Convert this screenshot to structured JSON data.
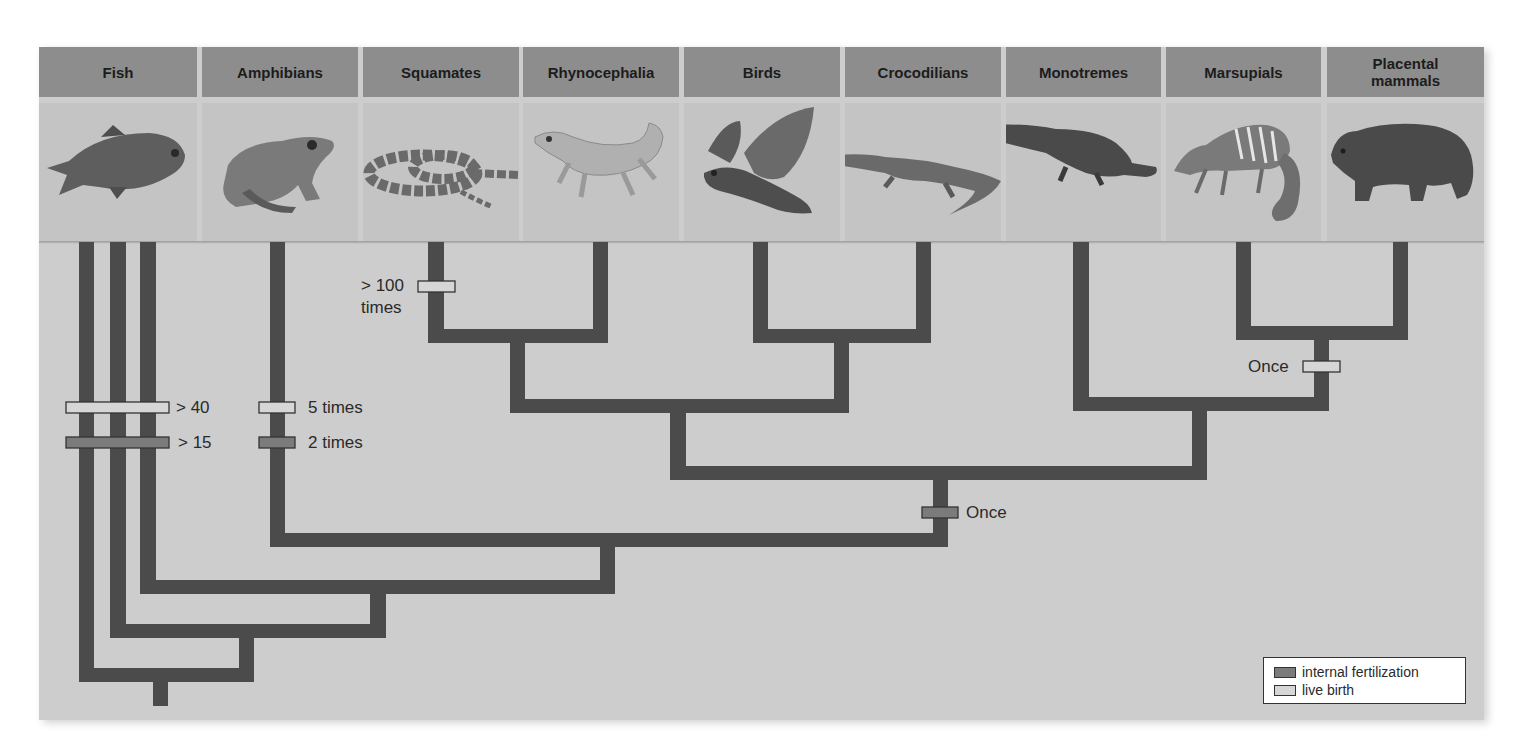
{
  "diagram": {
    "type": "cladogram",
    "columns": [
      {
        "label": "Fish",
        "icon": "fish-icon"
      },
      {
        "label": "Amphibians",
        "icon": "frog-icon"
      },
      {
        "label": "Squamates",
        "icon": "snake-icon"
      },
      {
        "label": "Rhynocephalia",
        "icon": "tuatara-icon"
      },
      {
        "label": "Birds",
        "icon": "bird-icon"
      },
      {
        "label": "Crocodilians",
        "icon": "crocodile-icon"
      },
      {
        "label": "Monotremes",
        "icon": "platypus-icon"
      },
      {
        "label": "Marsupials",
        "icon": "numbat-icon"
      },
      {
        "label": "Placental mammals",
        "icon": "bear-icon"
      }
    ],
    "markers": [
      {
        "lineage": "Fish",
        "trait": "live birth",
        "label": "> 40"
      },
      {
        "lineage": "Fish",
        "trait": "internal fertilization",
        "label": "> 15"
      },
      {
        "lineage": "Amphibians",
        "trait": "live birth",
        "label": "5 times"
      },
      {
        "lineage": "Amphibians",
        "trait": "internal fertilization",
        "label": "2 times"
      },
      {
        "lineage": "Squamates",
        "trait": "live birth",
        "label_line1": "> 100",
        "label_line2": "times"
      },
      {
        "lineage": "Amniotes",
        "trait": "internal fertilization",
        "label": "Once"
      },
      {
        "lineage": "Therian mammals",
        "trait": "live birth",
        "label": "Once"
      }
    ],
    "legend": {
      "items": [
        {
          "label": "internal fertilization",
          "color": "#7b7b7b"
        },
        {
          "label": "live birth",
          "color": "#d6d6d6"
        }
      ]
    },
    "colors": {
      "panel": "#cdcdcd",
      "header": "#8d8d8d",
      "image_cell": "#c4c4c4",
      "branch": "#4b4b4b",
      "internal_fertilization": "#7b7b7b",
      "live_birth": "#d6d6d6"
    }
  }
}
